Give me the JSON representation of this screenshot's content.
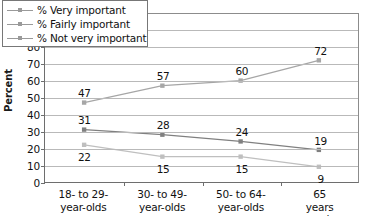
{
  "chart_data": {
    "type": "line",
    "title": "",
    "subtitle": "",
    "xlabel": "",
    "ylabel": "Percent",
    "ylim": [
      0,
      100
    ],
    "ytick_step": 10,
    "yticks": [
      100,
      90,
      80,
      70,
      60,
      50,
      40,
      30,
      20,
      10,
      0
    ],
    "grid": true,
    "grid_axis": "y",
    "legend_position": "top-left-inside",
    "categories": [
      "18- to 29-\nyear-olds",
      "30- to 49-\nyear-olds",
      "50- to 64-\nyear-olds",
      "65 years and\nolder"
    ],
    "category_lines": [
      [
        "18- to 29-",
        "year-olds"
      ],
      [
        "30- to 49-",
        "year-olds"
      ],
      [
        "50- to 64-",
        "year-olds"
      ],
      [
        "65 years and",
        "older"
      ]
    ],
    "series": [
      {
        "name": "% Very important",
        "values": [
          47,
          57,
          60,
          72
        ],
        "color": "#a6a6a6",
        "marker": "square",
        "label_positions": [
          "above",
          "above",
          "above",
          "above"
        ]
      },
      {
        "name": "% Fairly important",
        "values": [
          31,
          28,
          24,
          19
        ],
        "color": "#808080",
        "marker": "square",
        "label_positions": [
          "above",
          "above",
          "above",
          "above"
        ]
      },
      {
        "name": "% Not very important",
        "values": [
          22,
          15,
          15,
          9
        ],
        "color": "#bfbfbf",
        "marker": "square",
        "label_positions": [
          "below",
          "below",
          "below",
          "below"
        ]
      }
    ]
  },
  "legend": {
    "items": [
      {
        "label": "% Very important"
      },
      {
        "label": "% Fairly important"
      },
      {
        "label": "% Not very important"
      }
    ]
  },
  "axes": {
    "y_title": "Percent"
  },
  "colors": {
    "axis": "#6e6e6e",
    "gridline": "#b9b9b9",
    "text": "#111111",
    "background": "#ffffff"
  }
}
